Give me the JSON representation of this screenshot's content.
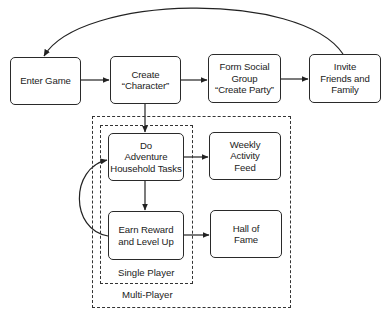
{
  "diagram": {
    "nodes": [
      {
        "id": "enter_game",
        "label": "Enter Game"
      },
      {
        "id": "create_character",
        "label": "Create\n“Character”"
      },
      {
        "id": "form_social_group",
        "label": "Form Social\nGroup\n“Create Party”"
      },
      {
        "id": "invite_friends",
        "label": "Invite\nFriends and\nFamily"
      },
      {
        "id": "do_adventure",
        "label": "Do\nAdventure\nHousehold Tasks"
      },
      {
        "id": "weekly_feed",
        "label": "Weekly\nActivity\nFeed"
      },
      {
        "id": "earn_reward",
        "label": "Earn Reward\nand Level Up"
      },
      {
        "id": "hall_of_fame",
        "label": "Hall of\nFame"
      }
    ],
    "groups": [
      {
        "id": "multi_player",
        "label": "Multi-Player"
      },
      {
        "id": "single_player",
        "label": "Single Player"
      }
    ],
    "edges": [
      {
        "from": "enter_game",
        "to": "create_character"
      },
      {
        "from": "create_character",
        "to": "form_social_group"
      },
      {
        "from": "form_social_group",
        "to": "invite_friends"
      },
      {
        "from": "invite_friends",
        "to": "enter_game",
        "style": "curved"
      },
      {
        "from": "create_character",
        "to": "do_adventure"
      },
      {
        "from": "do_adventure",
        "to": "weekly_feed"
      },
      {
        "from": "do_adventure",
        "to": "earn_reward"
      },
      {
        "from": "earn_reward",
        "to": "hall_of_fame"
      },
      {
        "from": "earn_reward",
        "to": "do_adventure",
        "style": "curved"
      }
    ]
  }
}
